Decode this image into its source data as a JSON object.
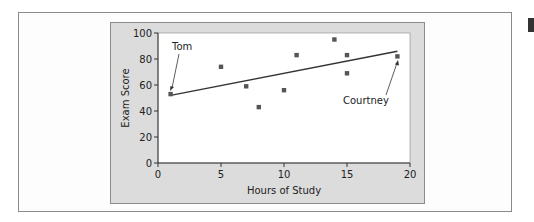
{
  "chart_data": {
    "type": "scatter",
    "title": "",
    "xlabel": "Hours of Study",
    "ylabel": "Exam Score",
    "xlim": [
      0,
      20
    ],
    "ylim": [
      0,
      100
    ],
    "x_ticks": [
      0,
      5,
      10,
      15,
      20
    ],
    "y_ticks": [
      0,
      20,
      40,
      60,
      80,
      100
    ],
    "grid": false,
    "legend": null,
    "series": [
      {
        "name": "Students",
        "marker": "square",
        "color": "#555555",
        "points": [
          {
            "x": 1,
            "y": 53
          },
          {
            "x": 5,
            "y": 74
          },
          {
            "x": 7,
            "y": 59
          },
          {
            "x": 8,
            "y": 43
          },
          {
            "x": 10,
            "y": 56
          },
          {
            "x": 11,
            "y": 83
          },
          {
            "x": 14,
            "y": 95
          },
          {
            "x": 15,
            "y": 83
          },
          {
            "x": 15,
            "y": 69
          },
          {
            "x": 19,
            "y": 82
          }
        ]
      }
    ],
    "trend_line": {
      "x1": 1,
      "y1": 52,
      "x2": 19,
      "y2": 86,
      "color": "#333333"
    },
    "annotations": [
      {
        "text": "Tom",
        "point": {
          "x": 1,
          "y": 53
        }
      },
      {
        "text": "Courtney",
        "point": {
          "x": 19,
          "y": 82
        }
      }
    ]
  },
  "labels": {
    "xlabel": "Hours of Study",
    "ylabel": "Exam Score",
    "tom": "Tom",
    "courtney": "Courtney",
    "xt0": "0",
    "xt5": "5",
    "xt10": "10",
    "xt15": "15",
    "xt20": "20",
    "yt0": "0",
    "yt20": "20",
    "yt40": "40",
    "yt60": "60",
    "yt80": "80",
    "yt100": "100"
  }
}
